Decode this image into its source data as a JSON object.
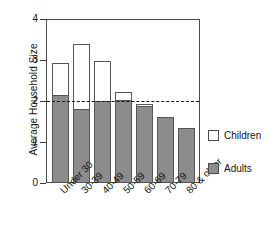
{
  "chart_data": {
    "type": "bar",
    "subtype": "stacked",
    "title": "",
    "subtitle": "",
    "xlabel": "",
    "ylabel": "Average Household Size",
    "ylim": [
      0,
      4
    ],
    "yticks": [
      0,
      1,
      2,
      3,
      4
    ],
    "ytick_labels": [
      "0",
      "1",
      "2",
      "3",
      "4"
    ],
    "grid": false,
    "legend_position": "right",
    "categories": [
      "Under 30",
      "30-39",
      "40-49",
      "50-59",
      "60-69",
      "70-79",
      "80 & older"
    ],
    "series": [
      {
        "name": "Adults",
        "color": "#8c8c8c",
        "values": [
          2.15,
          1.81,
          2.0,
          2.02,
          1.89,
          1.6,
          1.33
        ]
      },
      {
        "name": "Children",
        "color": "#ffffff",
        "values": [
          0.78,
          1.57,
          0.98,
          0.2,
          0.04,
          0.0,
          0.0
        ]
      }
    ],
    "totals": [
      2.93,
      3.38,
      2.98,
      2.22,
      1.93,
      1.6,
      1.33
    ],
    "annotations": [
      {
        "name": "reference-line",
        "type": "hline",
        "value": 2,
        "style": "dashed",
        "color": "#151515"
      }
    ]
  },
  "legend": {
    "items": [
      {
        "label": "Children",
        "swatch": "children"
      },
      {
        "label": "Adults",
        "swatch": "adults"
      }
    ]
  }
}
